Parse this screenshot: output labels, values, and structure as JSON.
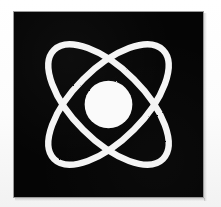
{
  "image": {
    "title": "Atom Symbol",
    "subject": "atom",
    "alt_text": "White atom symbol on a black square: two crossed elliptical electron orbits around a filled nucleus",
    "width": 221,
    "height": 207,
    "style": "high-contrast monochrome line illustration"
  },
  "frame": {
    "name": "picture-frame",
    "border_color": "#9a9a9a",
    "border_width_px": 1,
    "left": 13,
    "top": 11,
    "width": 191,
    "height": 187,
    "outer_margin_color": "#fdfdfd"
  },
  "field": {
    "background_color": "#050505",
    "label": "black background panel"
  },
  "atom": {
    "stroke_color": "#f4f4f4",
    "fill_color": "#fafafa",
    "center_x": 103,
    "center_y": 95,
    "nucleus": {
      "name": "nucleus",
      "label": "Nucleus",
      "radius": 26,
      "center_x": 103,
      "center_y": 95,
      "fill": "#fafafa"
    },
    "orbits": [
      {
        "name": "orbit-1",
        "label": "Electron orbit 1",
        "rotation_deg": 45,
        "radius_x": 84,
        "radius_y": 39,
        "stroke_width": 7
      },
      {
        "name": "orbit-2",
        "label": "Electron orbit 2",
        "rotation_deg": -45,
        "radius_x": 84,
        "radius_y": 39,
        "stroke_width": 7
      }
    ],
    "crossings": [
      {
        "name": "crossing-top",
        "x": 103,
        "y": 47
      },
      {
        "name": "crossing-bottom",
        "x": 103,
        "y": 143
      },
      {
        "name": "crossing-left",
        "x": 49,
        "y": 95
      },
      {
        "name": "crossing-right",
        "x": 157,
        "y": 95
      }
    ]
  }
}
